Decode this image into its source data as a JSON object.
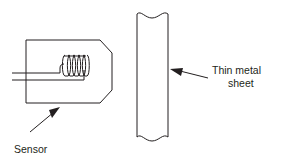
{
  "diagram": {
    "background_color": "#ffffff",
    "line_color": "#231f20",
    "labels": {
      "sensor": "Sensor",
      "sheet_line1": "Thin metal",
      "sheet_line2": "sheet"
    },
    "parts": {
      "sensor_body_name": "sensor-housing",
      "coil_name": "sensor-coil",
      "coil_turns": 5,
      "leads_name": "sensor-lead-wires",
      "sheet_name": "thin-metal-sheet",
      "sheet_break_style": "wavy-break-line"
    }
  }
}
